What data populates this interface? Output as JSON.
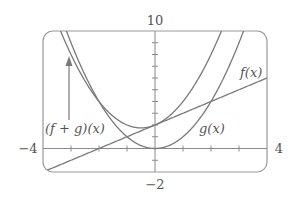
{
  "chart_data": {
    "type": "line",
    "title": "",
    "xlabel": "",
    "ylabel": "",
    "xlim": [
      -4,
      4
    ],
    "ylim": [
      -2,
      10
    ],
    "xticks_step": 1,
    "yticks_step": 1,
    "grid": false,
    "window_labels": {
      "xmin": "−4",
      "xmax": "4",
      "ymin": "−2",
      "ymax": "10"
    },
    "series": [
      {
        "name": "f(x)",
        "expression": "x + 2",
        "x": [
          -4,
          -2,
          0,
          2,
          4
        ],
        "values": [
          -2,
          0,
          2,
          4,
          6
        ]
      },
      {
        "name": "g(x)",
        "expression": "x^2",
        "x": [
          -3,
          -2,
          -1,
          0,
          1,
          2,
          3
        ],
        "values": [
          9,
          4,
          1,
          0,
          1,
          4,
          9
        ]
      },
      {
        "name": "(f + g)(x)",
        "expression": "x^2 + x + 2",
        "x": [
          -3,
          -2,
          -1,
          -0.5,
          0,
          1,
          2
        ],
        "values": [
          8,
          4,
          2,
          1.75,
          2,
          4,
          8
        ]
      }
    ],
    "annotations": [
      {
        "text": "f(x)",
        "target": "f(x)"
      },
      {
        "text": "g(x)",
        "target": "g(x)"
      },
      {
        "text": "(f + g)(x)",
        "target": "(f + g)(x)",
        "arrow": "up"
      }
    ],
    "colors": {
      "curve": "#7a7a7a",
      "axis": "#8a8a8a",
      "frame": "#9a9a9a",
      "text": "#555555"
    }
  }
}
